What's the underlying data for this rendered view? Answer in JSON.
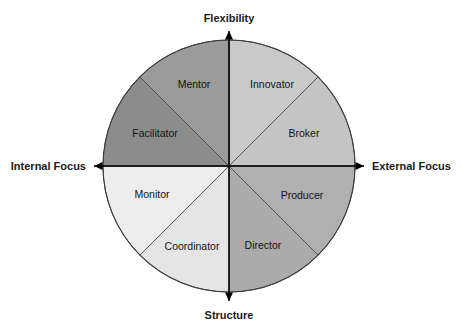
{
  "figure": {
    "background_color": "#ffffff"
  },
  "axes": {
    "top": {
      "label": "Flexibility",
      "name": "axis-label-flexibility",
      "direction": "up"
    },
    "right": {
      "label": "External Focus",
      "name": "axis-label-external-focus",
      "direction": "right"
    },
    "bottom": {
      "label": "Structure",
      "name": "axis-label-structure",
      "direction": "down"
    },
    "left": {
      "label": "Internal Focus",
      "name": "axis-label-internal-focus",
      "direction": "left"
    }
  },
  "wheel": {
    "center_x": 229,
    "center_y": 166,
    "radius": 126,
    "segment_count": 8,
    "outline_color": "#3d3d3d",
    "divider_color": "#4a4a4a"
  },
  "segments": [
    {
      "label": "Innovator",
      "fill": "#c9c9c9",
      "start_deg": 0,
      "end_deg": 45,
      "label_x": 272,
      "label_y": 88
    },
    {
      "label": "Broker",
      "fill": "#c4c4c4",
      "start_deg": 45,
      "end_deg": 90,
      "label_x": 304,
      "label_y": 137
    },
    {
      "label": "Producer",
      "fill": "#b0b0b0",
      "start_deg": 90,
      "end_deg": 135,
      "label_x": 302,
      "label_y": 199
    },
    {
      "label": "Director",
      "fill": "#ababab",
      "start_deg": 135,
      "end_deg": 180,
      "label_x": 263,
      "label_y": 249
    },
    {
      "label": "Coordinator",
      "fill": "#e4e4e4",
      "start_deg": 180,
      "end_deg": 225,
      "label_x": 192,
      "label_y": 250
    },
    {
      "label": "Monitor",
      "fill": "#ededed",
      "start_deg": 225,
      "end_deg": 270,
      "label_x": 152,
      "label_y": 198
    },
    {
      "label": "Facilitator",
      "fill": "#8c8c8c",
      "start_deg": 270,
      "end_deg": 315,
      "label_x": 155,
      "label_y": 137
    },
    {
      "label": "Mentor",
      "fill": "#9b9b9b",
      "start_deg": 315,
      "end_deg": 360,
      "label_x": 194,
      "label_y": 88
    }
  ]
}
